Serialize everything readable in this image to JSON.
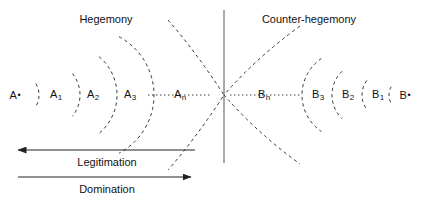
{
  "diagram": {
    "title_left": "Hegemony",
    "title_right": "Counter-hegemony",
    "divider": {
      "name": "central-vertical-axis",
      "x": 224,
      "y_top": 10,
      "y_bottom": 163,
      "color": "#555555"
    },
    "baseline_y": 95,
    "colors": {
      "arc_stroke": "#333333",
      "axis_stroke": "#222222",
      "text": "#111111",
      "divider": "#555555",
      "background": "#ffffff"
    },
    "left_nodes": [
      {
        "label": "A",
        "mark": "•",
        "mark_type": "bullet",
        "x": 15,
        "arc_radius": 22,
        "arc_span": 62
      },
      {
        "label": "A",
        "mark": "1",
        "mark_type": "subscript",
        "x": 56,
        "arc_radius": 34,
        "arc_span": 78
      },
      {
        "label": "A",
        "mark": "2",
        "mark_type": "subscript",
        "x": 93,
        "arc_radius": 50,
        "arc_span": 100
      },
      {
        "label": "A",
        "mark": "3",
        "mark_type": "subscript",
        "x": 130,
        "arc_radius": 66,
        "arc_span": 124
      },
      {
        "label": "A",
        "mark": "n",
        "mark_type": "subscript",
        "x": 180,
        "arc_radius": 0,
        "arc_span": 0
      }
    ],
    "right_nodes": [
      {
        "label": "B",
        "mark": "n",
        "mark_type": "subscript",
        "x": 264,
        "arc_radius": 0,
        "arc_span": 0
      },
      {
        "label": "B",
        "mark": "3",
        "mark_type": "subscript",
        "x": 318,
        "arc_radius": 44,
        "arc_span": 112
      },
      {
        "label": "B",
        "mark": "2",
        "mark_type": "subscript",
        "x": 348,
        "arc_radius": 33,
        "arc_span": 92
      },
      {
        "label": "B",
        "mark": "1",
        "mark_type": "subscript",
        "x": 378,
        "arc_radius": 24,
        "arc_span": 74
      },
      {
        "label": "B",
        "mark": "•",
        "mark_type": "bullet",
        "x": 405,
        "arc_radius": 17,
        "arc_span": 58
      }
    ],
    "dotted_connectors": [
      {
        "name": "dotted-connector-left",
        "x1": 148,
        "x2": 212,
        "y": 95
      },
      {
        "name": "dotted-connector-right",
        "x1": 230,
        "x2": 300,
        "y": 95
      }
    ],
    "arrows": [
      {
        "name": "legitimation-arrow",
        "caption": "Legitimation",
        "direction": "left",
        "x_start": 195,
        "x_end": 18,
        "y": 150,
        "caption_x": 107,
        "caption_y": 157
      },
      {
        "name": "domination-arrow",
        "caption": "Domination",
        "direction": "right",
        "x_start": 18,
        "x_end": 191,
        "y": 177,
        "caption_x": 107,
        "caption_y": 184
      }
    ],
    "title_left_x": 106,
    "title_left_y": 14,
    "title_right_x": 309,
    "title_right_y": 14
  }
}
